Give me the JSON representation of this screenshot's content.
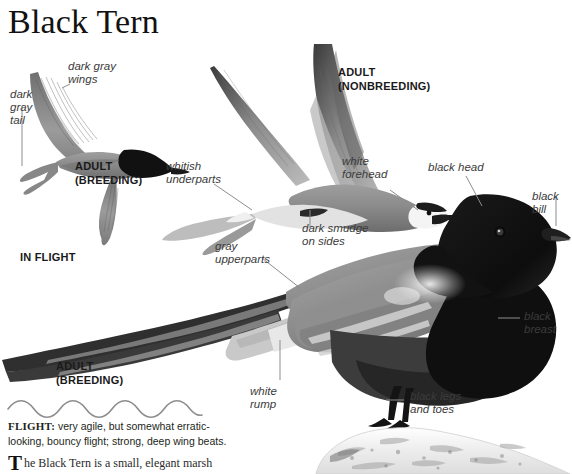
{
  "page": {
    "title": "Black Tern",
    "width": 572,
    "height": 474,
    "background": "#ffffff"
  },
  "figures": {
    "flying_breeding": {
      "name": "adult breeding in flight",
      "caption": "ADULT\n(BREEDING)",
      "group_caption": "IN FLIGHT",
      "labels": [
        {
          "id": "dark-gray-wings",
          "text": "dark gray\nwings"
        },
        {
          "id": "dark-gray-tail",
          "text": "dark\ngray\ntail"
        }
      ]
    },
    "flying_nonbreeding": {
      "name": "adult nonbreeding in flight",
      "caption": "ADULT\n(NONBREEDING)",
      "labels": [
        {
          "id": "whitish-underparts",
          "text": "whitish\nunderparts"
        },
        {
          "id": "white-forehead",
          "text": "white\nforehead"
        },
        {
          "id": "dark-smudge-on-sides",
          "text": "dark smudge\non sides"
        }
      ]
    },
    "perched_breeding": {
      "name": "adult breeding perched",
      "caption": "ADULT\n(BREEDING)",
      "labels": [
        {
          "id": "gray-upperparts",
          "text": "gray\nupperparts"
        },
        {
          "id": "black-head",
          "text": "black head"
        },
        {
          "id": "black-bill",
          "text": "black\nbill"
        },
        {
          "id": "black-breast",
          "text": "black\nbreast"
        },
        {
          "id": "white-rump",
          "text": "white\nrump"
        },
        {
          "id": "black-legs-and-toes",
          "text": "black legs\nand toes"
        }
      ]
    }
  },
  "flight_note": {
    "heading": "FLIGHT:",
    "text": " very agile, but somewhat erratic-looking, bouncy flight; strong, deep wing beats."
  },
  "body_text": {
    "dropcap": "T",
    "text": "he Black Tern is a small, elegant marsh"
  },
  "colors": {
    "ink": "#231f20",
    "leader": "#8d8d8d",
    "label": "#3b3b3b",
    "plumage_dark": "#2d2d2d",
    "plumage_gray": "#8b8b8b",
    "plumage_light": "#d8d8d8"
  }
}
